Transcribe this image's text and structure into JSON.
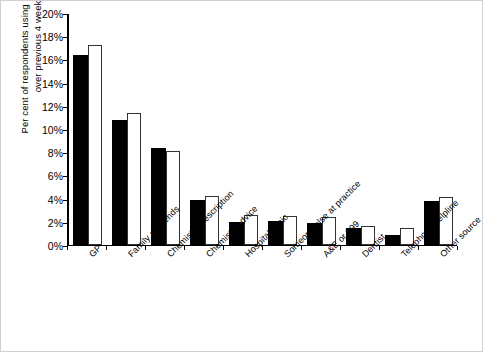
{
  "chart_data": {
    "type": "bar",
    "title": "",
    "xlabel": "",
    "ylabel": "Per cent of respondents using this source\nover previous 4 weeks",
    "ylim": [
      0,
      20
    ],
    "ytick_labels": [
      "20%",
      "18%",
      "16%",
      "14%",
      "12%",
      "10%",
      "8%",
      "6%",
      "4%",
      "2%",
      "0%"
    ],
    "ytick_values": [
      20,
      18,
      16,
      14,
      12,
      10,
      8,
      6,
      4,
      2,
      0
    ],
    "grid": false,
    "legend_position": "none",
    "categories": [
      "GP",
      "Family or friends",
      "Chemist - prescription",
      "Chemist - advice",
      "Hospital clinic",
      "Someone else at practice",
      "A&E or 999",
      "Dentist",
      "Telephone helpline",
      "Other source"
    ],
    "series": [
      {
        "name": "series-black",
        "color": "#000000",
        "values": [
          16.4,
          10.8,
          8.4,
          3.9,
          2.0,
          2.1,
          1.9,
          1.5,
          0.9,
          3.8
        ]
      },
      {
        "name": "series-white",
        "color": "#ffffff",
        "values": [
          17.2,
          11.4,
          8.1,
          4.2,
          2.6,
          2.5,
          2.4,
          1.6,
          1.5,
          4.1
        ]
      }
    ]
  }
}
